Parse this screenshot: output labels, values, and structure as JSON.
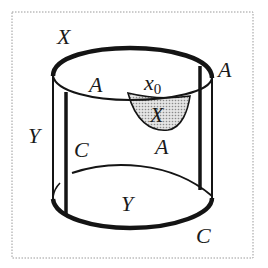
{
  "figure": {
    "colors": {
      "stroke": "#141414",
      "shade": "#c8c8c8",
      "border": "#9a9a9a",
      "background": "#ffffff"
    },
    "labels": {
      "x_top": "X",
      "a_top_left": "A",
      "x0_base": "x",
      "x0_sub": "0",
      "a_right": "A",
      "x_cup": "X",
      "y_left": "Y",
      "c_left": "C",
      "a_cup_bottom": "A",
      "y_bottom": "Y",
      "c_bottom_right": "C"
    }
  }
}
